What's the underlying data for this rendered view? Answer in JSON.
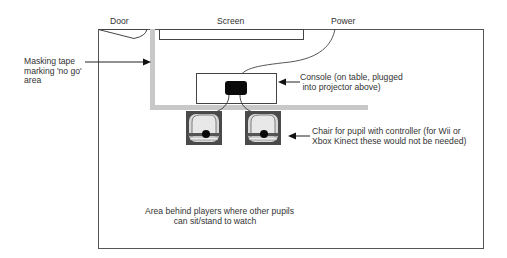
{
  "diagram": {
    "labels": {
      "door": "Door",
      "screen": "Screen",
      "power": "Power",
      "masking_tape": [
        "Masking tape",
        "marking 'no go'",
        "area"
      ],
      "console": [
        "Console (on table, plugged",
        " into projector above)"
      ],
      "chair": [
        "Chair for pupil with controller (for Wii or",
        "Xbox Kinect these would not be needed)"
      ],
      "audience_area": [
        "Area behind players where other pupils",
        "can sit/stand to watch"
      ]
    },
    "colors": {
      "line": "#3a3a3a",
      "tape": "#c8c8c8",
      "console": "#0a0a0a",
      "chair_frame": "#3a3a3a",
      "chair_seat": "#d8d8d8"
    }
  }
}
